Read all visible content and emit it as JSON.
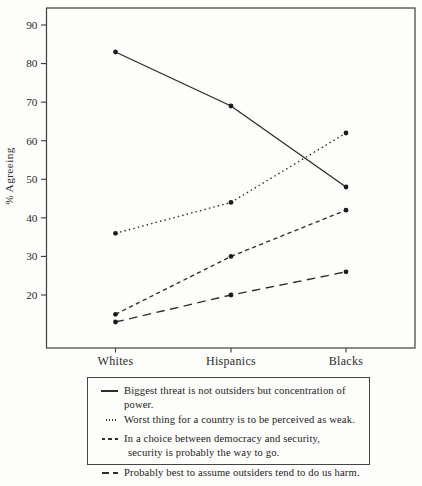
{
  "chart_data": {
    "type": "line",
    "title": "",
    "xlabel": "",
    "ylabel": "% Agreeing",
    "categories": [
      "Whites",
      "Hispanics",
      "Blacks"
    ],
    "yticks": [
      90,
      80,
      70,
      60,
      50,
      40,
      30,
      20
    ],
    "ylim": [
      6,
      95
    ],
    "grid": false,
    "legend_position": "bottom-box",
    "line_color": "#2d2d2d",
    "marker": "filled-circle",
    "series": [
      {
        "name": "Biggest threat is not outsiders but concentration of power.",
        "style": "solid",
        "values": [
          83,
          69,
          48
        ]
      },
      {
        "name": "Worst thing for a country is to be perceived as weak.",
        "style": "dotted",
        "values": [
          36,
          44,
          62
        ]
      },
      {
        "name": "In a choice between democracy and security, security is probably the way to go.",
        "style": "short-dash",
        "values": [
          15,
          30,
          42
        ]
      },
      {
        "name": "Probably best to assume outsiders tend to do us harm.",
        "style": "long-dash",
        "values": [
          13,
          20,
          26
        ]
      }
    ]
  },
  "legend": {
    "items": [
      {
        "style": "solid",
        "lines": [
          "Biggest threat is not outsiders but concentration of power."
        ]
      },
      {
        "style": "dotted",
        "lines": [
          "Worst thing for a country is to be perceived as weak."
        ]
      },
      {
        "style": "short-dash",
        "lines": [
          "In a choice between democracy and security,",
          "security is probably the way to go."
        ]
      },
      {
        "style": "long-dash",
        "lines": [
          "Probably best to assume outsiders tend to do us harm."
        ]
      }
    ]
  }
}
